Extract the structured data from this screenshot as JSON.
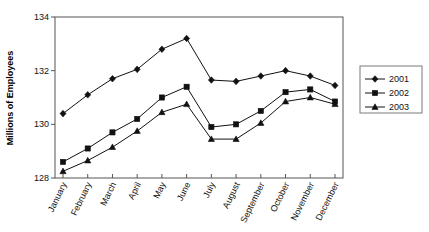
{
  "chart_data": {
    "type": "line",
    "title": "",
    "xlabel": "",
    "ylabel": "Millions of Employees",
    "categories": [
      "January",
      "February",
      "March",
      "April",
      "May",
      "June",
      "July",
      "August",
      "September",
      "October",
      "November",
      "December"
    ],
    "ylim": [
      128,
      134
    ],
    "yticks": [
      128,
      130,
      132,
      134
    ],
    "ytick_labels": [
      "128",
      "130",
      "132",
      "134"
    ],
    "grid": false,
    "legend_position": "right",
    "series": [
      {
        "name": "2001",
        "marker": "diamond",
        "values": [
          130.4,
          131.1,
          131.7,
          132.05,
          132.8,
          133.2,
          131.65,
          131.6,
          131.8,
          132.0,
          131.8,
          131.45
        ]
      },
      {
        "name": "2002",
        "marker": "square",
        "values": [
          128.6,
          129.1,
          129.7,
          130.2,
          131.0,
          131.4,
          129.9,
          130.0,
          130.5,
          131.2,
          131.3,
          130.85
        ]
      },
      {
        "name": "2003",
        "marker": "triangle",
        "values": [
          128.25,
          128.65,
          129.15,
          129.75,
          130.45,
          130.75,
          129.45,
          129.45,
          130.05,
          130.85,
          131.0,
          130.75
        ]
      }
    ]
  },
  "colors": {
    "series": "#111111",
    "axis": "#555555",
    "legend_border": "#7a7a7a",
    "background": "#ffffff"
  }
}
